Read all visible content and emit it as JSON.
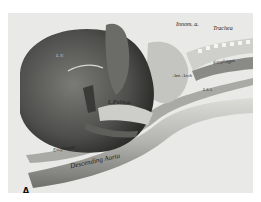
{
  "figure": {
    "panel_label": "A",
    "labels": {
      "innominate": "Innom. a.",
      "trachea": "Trachea",
      "esophagus_upper": "Esophagus",
      "left_ventricle": "L.V.",
      "anterior_arch": "Ant. Arch",
      "left_subclavian": "L.S.A.",
      "left_pulmonary": "L.Pulm.a.",
      "posterior_arch": "Post. Arch",
      "esophagus_lower": "Esophagus",
      "descending_aorta": "Descending Aorta"
    },
    "colors": {
      "background": "#e9e9e7",
      "heart": "#5a5a58",
      "vessel": "#bdbdb9",
      "dark": "#2a2a28"
    }
  }
}
